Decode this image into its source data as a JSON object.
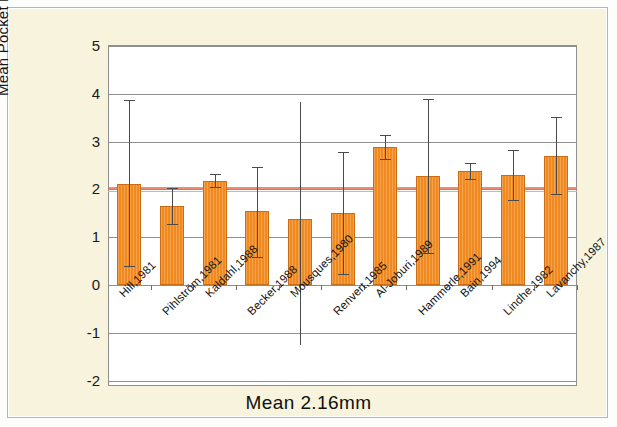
{
  "chart_data": {
    "type": "bar",
    "title": "Mean  2.16mm",
    "xlabel": "",
    "ylabel": "Mean Pocket Reduction",
    "ylim": [
      -2,
      5
    ],
    "yticks": [
      5,
      4,
      3,
      2,
      1,
      0,
      -1,
      -2
    ],
    "ytick_labels": [
      "5",
      "4",
      "3",
      "2",
      "1",
      "0",
      "-1",
      "-2"
    ],
    "grid": true,
    "legend": "none",
    "mean_line_value": 2.05,
    "mean_line_color": "#e8785a",
    "bar_color": "#f08a1e",
    "bar_edge_color": "#c96c14",
    "error_bar_color": "#4a4a4a",
    "categories": [
      "Hill,1981",
      "Pihlström,1981",
      "Kaldahl,1988",
      "Becker,1988",
      "Mousques,1980",
      "Renvert,1985",
      "Al-Joburi,1989",
      "Hammerle,1991",
      "Bain,1994",
      "Lindhe,1982",
      "Lavanchy,1987"
    ],
    "values": [
      2.12,
      1.66,
      2.18,
      1.55,
      1.38,
      1.51,
      2.88,
      2.28,
      2.39,
      2.3,
      2.7
    ],
    "error_low": [
      0.4,
      1.27,
      2.05,
      0.58,
      -1.25,
      0.22,
      2.63,
      0.67,
      2.22,
      1.78,
      1.9
    ],
    "error_high": [
      3.87,
      2.03,
      2.32,
      2.47,
      3.83,
      2.79,
      3.14,
      3.9,
      2.55,
      2.82,
      3.52
    ],
    "error_caps": [
      true,
      true,
      true,
      true,
      false,
      true,
      true,
      true,
      true,
      true,
      true
    ]
  },
  "axis": {
    "y_title": "Mean Pocket Reduction"
  },
  "footer": {
    "title": "Mean  2.16mm"
  }
}
